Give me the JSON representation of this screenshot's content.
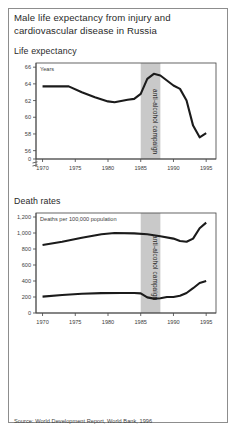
{
  "figure": {
    "title": "Male life expectancy from injury and cardiovascular disease in Russia",
    "source": "Source: World Development Report, World Bank, 1996"
  },
  "panels": {
    "top": {
      "heading": "Life expectancy",
      "unit_label": "Years",
      "band_label": "anti-alcohol campaign"
    },
    "bottom": {
      "heading": "Death rates",
      "unit_label": "Deaths per 100,000 population",
      "band_label": "anti-alcohol campaign"
    }
  },
  "chart_data": [
    {
      "type": "line",
      "title": "Life expectancy",
      "xlabel": "",
      "ylabel": "Years",
      "xlim": [
        1969,
        1996.5
      ],
      "ylim": [
        55,
        66.5
      ],
      "yticks": [
        56,
        58,
        60,
        62,
        64,
        66
      ],
      "ytick_labels": [
        "56",
        "58",
        "60",
        "62",
        "64",
        "66"
      ],
      "axis_break_label": "0",
      "xticks": [
        1970,
        1975,
        1980,
        1985,
        1990,
        1995
      ],
      "xtick_labels": [
        "1970",
        "1975",
        "1980",
        "1985",
        "1990",
        "1995"
      ],
      "grid": false,
      "legend": "none",
      "annotations": [
        {
          "type": "span",
          "label": "anti-alcohol campaign",
          "x_start": 1985,
          "x_end": 1988
        }
      ],
      "series": [
        {
          "name": "Male life expectancy",
          "x": [
            1970,
            1974,
            1976,
            1978,
            1980,
            1981,
            1983,
            1984,
            1985,
            1986,
            1987,
            1988,
            1989,
            1990,
            1991,
            1992,
            1993,
            1994,
            1995
          ],
          "values": [
            63.7,
            63.7,
            63.0,
            62.4,
            61.9,
            61.8,
            62.1,
            62.2,
            62.8,
            64.6,
            65.2,
            65.0,
            64.4,
            63.8,
            63.4,
            62.0,
            59.0,
            57.6,
            58.1
          ]
        }
      ]
    },
    {
      "type": "line",
      "title": "Death rates",
      "xlabel": "",
      "ylabel": "Deaths per 100,000 population",
      "xlim": [
        1969,
        1996.5
      ],
      "ylim": [
        0,
        1250
      ],
      "yticks": [
        0,
        200,
        400,
        600,
        800,
        1000,
        1200
      ],
      "ytick_labels": [
        "0",
        "200",
        "400",
        "600",
        "800",
        "1,000",
        "1,200"
      ],
      "xticks": [
        1970,
        1975,
        1980,
        1985,
        1990,
        1995
      ],
      "xtick_labels": [
        "1970",
        "1975",
        "1980",
        "1985",
        "1990",
        "1995"
      ],
      "grid": false,
      "legend": "none",
      "annotations": [
        {
          "type": "span",
          "label": "anti-alcohol campaign",
          "x_start": 1985,
          "x_end": 1988
        }
      ],
      "series": [
        {
          "name": "Cardiovascular disease deaths",
          "x": [
            1970,
            1973,
            1976,
            1979,
            1981,
            1984,
            1986,
            1988,
            1990,
            1991,
            1992,
            1993,
            1994,
            1995
          ],
          "values": [
            850,
            890,
            940,
            985,
            1000,
            995,
            985,
            960,
            930,
            900,
            890,
            930,
            1060,
            1130
          ]
        },
        {
          "name": "Injury deaths",
          "x": [
            1970,
            1973,
            1976,
            1979,
            1982,
            1984,
            1985,
            1986,
            1987,
            1988,
            1989,
            1990,
            1991,
            1992,
            1993,
            1994,
            1995
          ],
          "values": [
            205,
            225,
            240,
            248,
            250,
            250,
            245,
            195,
            180,
            185,
            200,
            200,
            215,
            250,
            310,
            375,
            400
          ]
        }
      ]
    }
  ]
}
